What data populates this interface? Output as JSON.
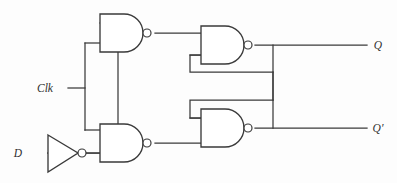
{
  "diagram": {
    "background_color": "#fdfdfd",
    "line_color": "#3a3a3a",
    "label_color": "#2f2f2f"
  },
  "labels": {
    "clk": "Clk",
    "d": "D",
    "q": "Q",
    "q_not": "Q′"
  },
  "gates": [
    {
      "id": "nand-top-left",
      "type": "NAND",
      "x": 100,
      "y": 14,
      "w": 48,
      "h": 38
    },
    {
      "id": "nand-bottom-left",
      "type": "NAND",
      "x": 100,
      "y": 124,
      "w": 48,
      "h": 38
    },
    {
      "id": "nand-top-right",
      "type": "NAND",
      "x": 201,
      "y": 26,
      "w": 48,
      "h": 38
    },
    {
      "id": "nand-bottom-right",
      "type": "NAND",
      "x": 201,
      "y": 109,
      "w": 48,
      "h": 38
    }
  ],
  "inverter": {
    "id": "inverter-d",
    "type": "NOT",
    "x": 48,
    "y": 135,
    "w": 31,
    "h": 37
  }
}
